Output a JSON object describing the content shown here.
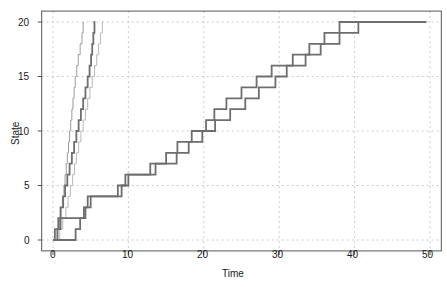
{
  "chart_data": {
    "type": "line",
    "variant": "step-post",
    "title": "",
    "subtitle": "",
    "xlabel": "Time",
    "ylabel": "State",
    "xlim": [
      -1.5,
      51.5
    ],
    "ylim": [
      -1.0,
      21.0
    ],
    "xticks": [
      0,
      10,
      20,
      30,
      40,
      50
    ],
    "xtick_labels": [
      "0",
      "10",
      "20",
      "30",
      "40",
      "50"
    ],
    "yticks": [
      0,
      5,
      10,
      15,
      20
    ],
    "ytick_labels": [
      "0",
      "5",
      "10",
      "15",
      "20"
    ],
    "grid": true,
    "grid_style": "dashed",
    "grid_color": "#bfbfbf",
    "frame": true,
    "frame_color": "#555555",
    "legend": "none",
    "annotations": [],
    "colors": {
      "fast_dark": "#707070",
      "fast_light": "#b5b5b5",
      "slow_dark": "#6e6e6e",
      "axis": "#4d4d4d",
      "text": "#1a1a1a",
      "background": "#ffffff"
    },
    "series": [
      {
        "name": "fast-path-1",
        "color": "#9a9a9a",
        "width": 1.0,
        "x": [
          0.0,
          0.55,
          0.85,
          1.05,
          1.25,
          1.45,
          1.6,
          1.75,
          1.9,
          2.05,
          2.2,
          2.35,
          2.5,
          2.65,
          2.8,
          2.95,
          3.15,
          3.35,
          3.6,
          3.85,
          4.0,
          4.05
        ],
        "y": [
          0,
          1,
          2,
          3,
          4,
          5,
          6,
          7,
          8,
          9,
          10,
          11,
          12,
          13,
          14,
          15,
          16,
          17,
          18,
          19,
          20,
          20
        ]
      },
      {
        "name": "fast-path-2",
        "color": "#6f6f6f",
        "width": 1.8,
        "x": [
          0.0,
          0.25,
          0.7,
          1.0,
          1.35,
          1.6,
          1.9,
          2.2,
          2.5,
          2.8,
          3.1,
          3.4,
          3.7,
          4.0,
          4.3,
          4.6,
          4.85,
          5.05,
          5.2,
          5.35,
          5.5,
          5.6
        ],
        "y": [
          0,
          1,
          2,
          3,
          4,
          5,
          6,
          7,
          8,
          9,
          10,
          11,
          12,
          13,
          14,
          15,
          16,
          17,
          18,
          19,
          20,
          20
        ]
      },
      {
        "name": "fast-path-3",
        "color": "#b8b8b8",
        "width": 1.0,
        "x": [
          0.0,
          0.9,
          1.3,
          1.7,
          2.0,
          2.3,
          2.6,
          2.85,
          3.1,
          3.4,
          3.7,
          4.0,
          4.3,
          4.6,
          4.9,
          5.2,
          5.5,
          5.8,
          6.05,
          6.3,
          6.55,
          6.7
        ],
        "y": [
          0,
          1,
          2,
          3,
          4,
          5,
          6,
          7,
          8,
          9,
          10,
          11,
          12,
          13,
          14,
          15,
          16,
          17,
          18,
          19,
          20,
          20
        ]
      },
      {
        "name": "slow-path-1",
        "color": "#6e6e6e",
        "width": 1.8,
        "x": [
          0.0,
          0.6,
          1.0,
          4.3,
          5.0,
          8.6,
          9.6,
          12.9,
          16.4,
          18.0,
          19.8,
          21.5,
          23.5,
          25.5,
          27.3,
          29.5,
          31.0,
          33.5,
          35.5,
          38.0,
          40.5,
          43.0,
          45.5,
          48.0,
          49.5
        ],
        "y": [
          0,
          1,
          2,
          3,
          4,
          5,
          6,
          7,
          8,
          9,
          10,
          11,
          12,
          13,
          14,
          15,
          16,
          17,
          18,
          19,
          20,
          20,
          20,
          20,
          20
        ]
      },
      {
        "name": "slow-path-2",
        "color": "#6e6e6e",
        "width": 1.8,
        "x": [
          0.0,
          1.4,
          3.0,
          3.6,
          4.1,
          4.6,
          7.6,
          9.1,
          10.0,
          12.8,
          13.6,
          15.0,
          16.5,
          18.4,
          20.3,
          21.4,
          23.0,
          25.0,
          27.0,
          29.0,
          31.8,
          34.0,
          36.0,
          38.0,
          40.0,
          49.5
        ],
        "y": [
          0,
          0,
          1,
          2,
          3,
          4,
          4,
          5,
          6,
          6,
          7,
          8,
          9,
          10,
          11,
          12,
          13,
          14,
          15,
          16,
          17,
          18,
          19,
          20,
          20,
          20
        ]
      }
    ]
  },
  "axes": {
    "xlabel": "Time",
    "ylabel": "State",
    "xtick_labels": [
      "0",
      "10",
      "20",
      "30",
      "40",
      "50"
    ],
    "ytick_labels": [
      "0",
      "5",
      "10",
      "15",
      "20"
    ]
  }
}
